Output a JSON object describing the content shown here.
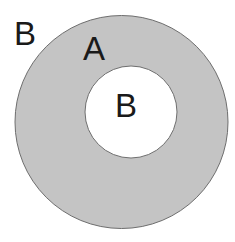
{
  "diagram": {
    "type": "set-complement",
    "colors": {
      "ring_fill": "#c4c4c4",
      "outline": "#6e6e6e",
      "background": "#ffffff",
      "text": "#1a1a1a"
    },
    "labels": {
      "outside": "B",
      "ring": "A",
      "inner": "B"
    }
  }
}
